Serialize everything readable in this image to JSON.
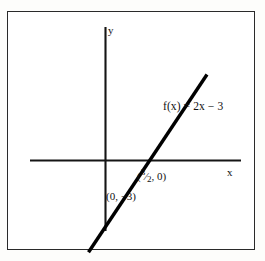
{
  "figure": {
    "kind": "coordinate-plane-line-graph",
    "background_color": "#ffffff",
    "frame_color": "#2a2a2a",
    "ink_color": "#111111"
  },
  "axes": {
    "x_axis_label": "x",
    "y_axis_label": "y",
    "x_axis": {
      "x1": 30,
      "y1": 160,
      "x2": 241,
      "y2": 160
    },
    "y_axis": {
      "x1": 105,
      "y1": 27,
      "x2": 105,
      "y2": 231
    },
    "origin": {
      "x": 105,
      "y": 160
    }
  },
  "labels": {
    "equation": "f(x) = 2x − 3",
    "x_intercept_text": "( 3/2 , 0 )",
    "x_intercept_numerator": "3",
    "x_intercept_slash": "⁄",
    "x_intercept_denominator": "2",
    "x_intercept_open": "(",
    "x_intercept_rest": ", 0)",
    "y_intercept": "(0, −3)"
  },
  "chart_data": {
    "type": "line",
    "title": "",
    "xlabel": "x",
    "ylabel": "y",
    "grid": false,
    "legend": null,
    "equation": "f(x) = 2x - 3",
    "slope": 2,
    "y_intercept_value": -3,
    "x_intercept_value": 1.5,
    "annotations": [
      {
        "text": "f(x) = 2x − 3",
        "x": 2.4,
        "y": 1.8
      },
      {
        "text": "(3/2, 0)",
        "x": 1.8,
        "y": -0.45
      },
      {
        "text": "(0, −3)",
        "x": 0.2,
        "y": -3.1
      }
    ],
    "points": [
      {
        "label": "(3/2, 0)",
        "x": 1.5,
        "y": 0
      },
      {
        "label": "(0, -3)",
        "x": 0,
        "y": -3
      }
    ],
    "series": [
      {
        "name": "f(x) = 2x - 3",
        "x": [
          -0.55,
          3.4
        ],
        "y": [
          -4.1,
          3.8
        ]
      }
    ],
    "xlim": [
      -2.6,
      3.9
    ],
    "ylim": [
      -4.4,
      4.3
    ]
  }
}
